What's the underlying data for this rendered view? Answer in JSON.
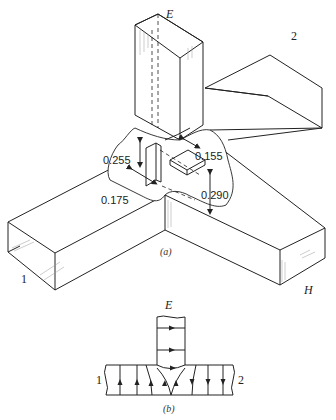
{
  "figure_a": {
    "caption": "(a)",
    "arm_labels": {
      "E": "E",
      "port1": "1",
      "port2": "2",
      "H": "H"
    },
    "dimensions": [
      "0.255",
      "0.155",
      "0.175",
      "0.290"
    ]
  },
  "figure_b": {
    "caption": "(b)",
    "arm_labels": {
      "E": "E",
      "port1": "1",
      "port2": "2"
    }
  }
}
